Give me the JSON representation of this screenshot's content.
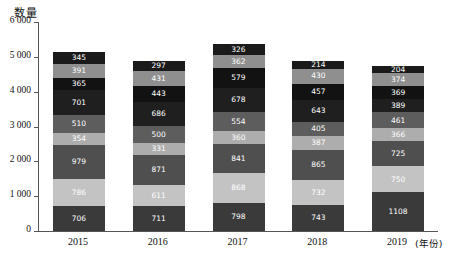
{
  "chart_data": {
    "type": "bar",
    "subtype": "stacked-column",
    "title": "",
    "xlabel": "(年份)",
    "ylabel": "数量",
    "ylim": [
      0,
      6000
    ],
    "ytick_values": [
      0,
      1000,
      2000,
      3000,
      4000,
      5000,
      6000
    ],
    "ytick_labels": [
      "0",
      "1 000",
      "2 000",
      "3 000",
      "4 000",
      "5 000",
      "6 000"
    ],
    "grid": false,
    "legend": "none",
    "categories": [
      "2015",
      "2016",
      "2017",
      "2018",
      "2019"
    ],
    "stack_order": "bottom-to-top",
    "series": [
      {
        "name": "S1",
        "color": "#3a3a3a",
        "values": [
          706,
          711,
          798,
          743,
          1108
        ]
      },
      {
        "name": "S2",
        "color": "#c3c3c3",
        "values": [
          786,
          611,
          868,
          732,
          750
        ]
      },
      {
        "name": "S3",
        "color": "#4f4f4f",
        "values": [
          979,
          871,
          841,
          865,
          725
        ]
      },
      {
        "name": "S4",
        "color": "#adadad",
        "values": [
          354,
          331,
          360,
          387,
          366
        ]
      },
      {
        "name": "S5",
        "color": "#5d5d5d",
        "values": [
          510,
          500,
          554,
          405,
          461
        ]
      },
      {
        "name": "S6",
        "color": "#1f1f1f",
        "values": [
          701,
          686,
          678,
          643,
          389
        ]
      },
      {
        "name": "S7",
        "color": "#121212",
        "values": [
          365,
          443,
          579,
          457,
          369
        ]
      },
      {
        "name": "S8",
        "color": "#8f8f8f",
        "values": [
          391,
          431,
          362,
          430,
          374
        ]
      },
      {
        "name": "S9",
        "color": "#1a1a1a",
        "values": [
          345,
          297,
          326,
          214,
          204
        ]
      }
    ],
    "totals": [
      5137,
      4881,
      5366,
      4876,
      4746
    ]
  },
  "axis": {
    "y_title": "数量",
    "x_unit": "(年份)"
  }
}
